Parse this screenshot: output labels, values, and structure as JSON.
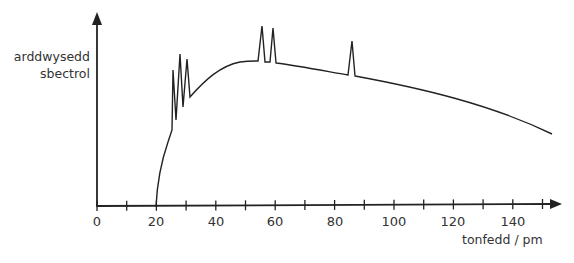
{
  "chart_data": {
    "type": "line",
    "title": "",
    "xlabel": "tonfedd / pm",
    "ylabel": "arddwysedd sbectrol",
    "xlim": [
      0,
      155
    ],
    "x_ticks": [
      0,
      10,
      20,
      30,
      40,
      50,
      60,
      70,
      80,
      90,
      100,
      110,
      120,
      130,
      140,
      150
    ],
    "x_tick_labels": [
      "0",
      "20",
      "40",
      "60",
      "80",
      "100",
      "120",
      "140"
    ],
    "y_ticks": [],
    "grid": false,
    "legend": null,
    "series": [
      {
        "name": "spectrum",
        "description": "Continuous X-ray spectrum starting at ~20 pm (cut-off wavelength), with characteristic line spikes",
        "points": [
          [
            20,
            0
          ],
          [
            21,
            20
          ],
          [
            22.5,
            40
          ],
          [
            24,
            52
          ],
          [
            26,
            57
          ],
          [
            26.5,
            89
          ],
          [
            27,
            55
          ],
          [
            28,
            100
          ],
          [
            29,
            65
          ],
          [
            30.5,
            96
          ],
          [
            31,
            72
          ],
          [
            33,
            78
          ],
          [
            36,
            83
          ],
          [
            40,
            88
          ],
          [
            45,
            91
          ],
          [
            50,
            92
          ],
          [
            54,
            92
          ],
          [
            55,
            118
          ],
          [
            56,
            92
          ],
          [
            58,
            92
          ],
          [
            59.5,
            116
          ],
          [
            60.5,
            92
          ],
          [
            65,
            90
          ],
          [
            70,
            88
          ],
          [
            75,
            86
          ],
          [
            80,
            84
          ],
          [
            85,
            82
          ],
          [
            86,
            108
          ],
          [
            87,
            81
          ],
          [
            95,
            79
          ],
          [
            105,
            75
          ],
          [
            115,
            70
          ],
          [
            125,
            65
          ],
          [
            135,
            59
          ],
          [
            145,
            52
          ],
          [
            153,
            46
          ]
        ]
      }
    ],
    "annotations": [
      "characteristic peaks near 27, 28, 30, 55, 59, 86 pm"
    ]
  },
  "labels": {
    "ylabel_line1": "arddwysedd",
    "ylabel_line2": "sbectrol",
    "xlabel": "tonfedd / pm",
    "ticks": {
      "t0": "0",
      "t20": "20",
      "t40": "40",
      "t60": "60",
      "t80": "80",
      "t100": "100",
      "t120": "120",
      "t140": "140"
    }
  }
}
